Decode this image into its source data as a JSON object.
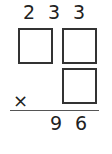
{
  "problem": {
    "top_digits": [
      "2",
      "3",
      "3"
    ],
    "operator": "×",
    "result_digits": [
      "9",
      "6"
    ],
    "blank_boxes": 3
  }
}
